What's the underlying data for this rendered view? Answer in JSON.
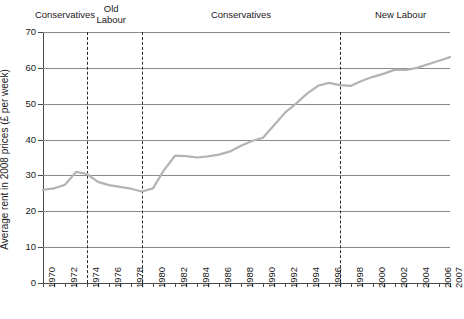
{
  "chart_data": {
    "type": "line",
    "title": "",
    "xlabel": "",
    "ylabel": "Average rent in 2008 prices (£ per week)",
    "ylim": [
      0,
      70
    ],
    "xlim": [
      1970,
      2007
    ],
    "ytick_labels": [
      "70",
      "60",
      "50",
      "40",
      "30",
      "20",
      "10",
      "0"
    ],
    "ytick_values": [
      70,
      60,
      50,
      40,
      30,
      20,
      10,
      0
    ],
    "ystep": 10,
    "grid": "horizontal",
    "legend": "none",
    "line_color": "#b3b3b3",
    "grid_color": "#8a8a8a",
    "axis_color": "#4a4a4a",
    "xtick_labels": [
      "1970",
      "1972",
      "1974",
      "1976",
      "1978",
      "1980",
      "1982",
      "1984",
      "1986",
      "1988",
      "1990",
      "1992",
      "1994",
      "1996",
      "1998",
      "2000",
      "2002",
      "2004",
      "2006",
      "2007"
    ],
    "x": [
      1970,
      1971,
      1972,
      1973,
      1974,
      1975,
      1976,
      1977,
      1978,
      1979,
      1980,
      1981,
      1982,
      1983,
      1984,
      1985,
      1986,
      1987,
      1988,
      1989,
      1990,
      1991,
      1992,
      1993,
      1994,
      1995,
      1996,
      1997,
      1998,
      1999,
      2000,
      2001,
      2002,
      2003,
      2004,
      2005,
      2006,
      2007
    ],
    "values": [
      26.0,
      26.4,
      27.4,
      31.0,
      30.4,
      28.2,
      27.3,
      26.8,
      26.3,
      25.5,
      26.4,
      31.5,
      35.5,
      35.4,
      35.0,
      35.3,
      35.8,
      36.7,
      38.3,
      39.6,
      40.5,
      44.0,
      47.5,
      50.0,
      52.8,
      55.0,
      55.8,
      55.2,
      55.0,
      56.4,
      57.5,
      58.4,
      59.5,
      59.4,
      60.0,
      61.0,
      62.0,
      63.0
    ],
    "annotations": [
      {
        "name": "era-conservatives-1",
        "label": "Conservatives",
        "x_center": 1972.0
      },
      {
        "name": "era-old-labour",
        "label": "Old\nLabour",
        "x_center": 1976.2
      },
      {
        "name": "era-conservatives-2",
        "label": "Conservatives",
        "x_center": 1988.0
      },
      {
        "name": "era-new-labour",
        "label": "New Labour",
        "x_center": 2002.5
      }
    ],
    "vertical_dashed_lines": [
      {
        "name": "divider-1974",
        "x": 1974
      },
      {
        "name": "divider-1979",
        "x": 1979
      },
      {
        "name": "divider-1997",
        "x": 1997
      }
    ]
  }
}
